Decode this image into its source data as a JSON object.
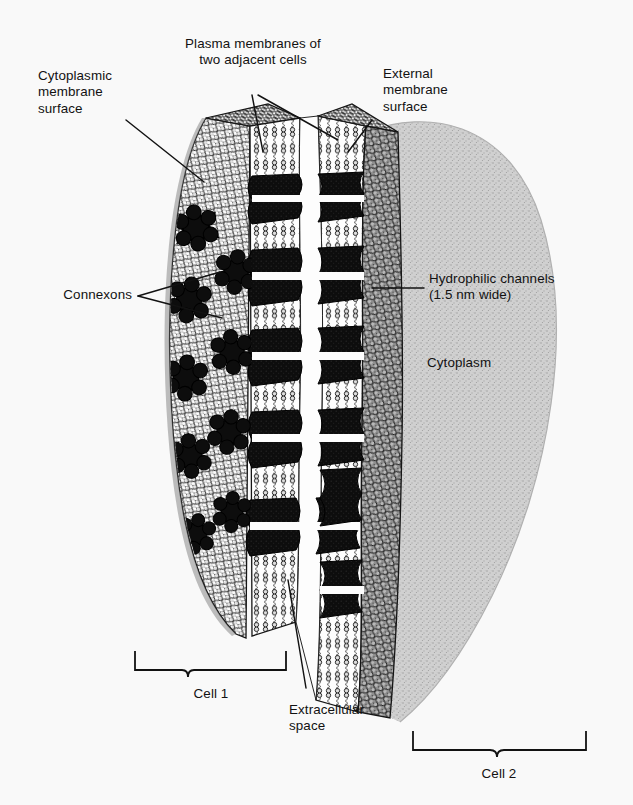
{
  "figure": {
    "background_color": "#f9f9f9",
    "ink_color": "#121212",
    "cytoplasm_color": "#c9c9c9",
    "membrane_head_color": "#d8d8d8",
    "connexon_color": "#101010",
    "channel_color": "#fefefe"
  },
  "labels": {
    "cytoplasmic_surface": "Cytoplasmic\nmembrane\nsurface",
    "plasma_membranes": "Plasma membranes of\ntwo adjacent cells",
    "external_surface": "External\nmembrane\nsurface",
    "hydrophilic_channels": "Hydrophilic channels\n(1.5 nm wide)",
    "cytoplasm": "Cytoplasm",
    "connexons": "Connexons",
    "cell_1": "Cell 1",
    "extracellular_space": "Extracellular\nspace",
    "cell_2": "Cell 2"
  },
  "measurements": {
    "channel_width": "1.5 nm"
  },
  "structure": {
    "connexon_surface_lobes": 6,
    "cells": [
      "Cell 1",
      "Cell 2"
    ],
    "channel_pairs": 5
  }
}
